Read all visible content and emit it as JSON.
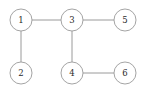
{
  "figure": {
    "type": "undirected-graph-diagram",
    "width": 145,
    "height": 93,
    "background_color": "#ffffff",
    "node_stroke_color": "#9a9a9a",
    "node_fill_color": "#ffffff",
    "edge_color": "#8e8e8e",
    "label_color": "#2b2b2b",
    "node_radius": 11
  },
  "nodes": [
    {
      "id": "1",
      "label": "1",
      "cx": 21,
      "cy": 20
    },
    {
      "id": "2",
      "label": "2",
      "cx": 21,
      "cy": 73
    },
    {
      "id": "3",
      "label": "3",
      "cx": 72,
      "cy": 20
    },
    {
      "id": "4",
      "label": "4",
      "cx": 72,
      "cy": 73
    },
    {
      "id": "5",
      "label": "5",
      "cx": 125,
      "cy": 20
    },
    {
      "id": "6",
      "label": "6",
      "cx": 125,
      "cy": 73
    }
  ],
  "edges": [
    {
      "id": "edge-1-3",
      "source": "1",
      "target": "3",
      "x1": 32,
      "y1": 20,
      "x2": 61,
      "y2": 20
    },
    {
      "id": "edge-3-5",
      "source": "3",
      "target": "5",
      "x1": 83,
      "y1": 20,
      "x2": 114,
      "y2": 20
    },
    {
      "id": "edge-1-2",
      "source": "1",
      "target": "2",
      "x1": 21,
      "y1": 31,
      "x2": 21,
      "y2": 62
    },
    {
      "id": "edge-3-4",
      "source": "3",
      "target": "4",
      "x1": 72,
      "y1": 31,
      "x2": 72,
      "y2": 62
    },
    {
      "id": "edge-4-6",
      "source": "4",
      "target": "6",
      "x1": 83,
      "y1": 73,
      "x2": 114,
      "y2": 73
    }
  ]
}
